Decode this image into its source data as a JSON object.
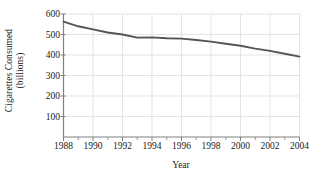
{
  "chart_data": {
    "type": "line",
    "title": "",
    "xlabel": "Year",
    "ylabel": "Cigarettes Consumed (billions)",
    "ylabel_line1": "Cigarettes Consumed",
    "ylabel_line2": "(billions)",
    "x": [
      1988,
      1989,
      1990,
      1991,
      1992,
      1993,
      1994,
      1995,
      1996,
      1997,
      1998,
      1999,
      2000,
      2001,
      2002,
      2003,
      2004
    ],
    "values": [
      563,
      540,
      525,
      510,
      500,
      485,
      486,
      482,
      480,
      473,
      465,
      455,
      445,
      431,
      420,
      406,
      392
    ],
    "series": [
      {
        "name": "Cigarettes Consumed",
        "values": [
          563,
          540,
          525,
          510,
          500,
          485,
          486,
          482,
          480,
          473,
          465,
          455,
          445,
          431,
          420,
          406,
          392
        ]
      }
    ],
    "xlim": [
      1988,
      2004
    ],
    "ylim": [
      0,
      600
    ],
    "ytick_labels": [
      "100",
      "200",
      "300",
      "400",
      "500",
      "600"
    ],
    "ytick_values": [
      100,
      200,
      300,
      400,
      500,
      600
    ],
    "xtick_labels": [
      "1988",
      "1990",
      "1992",
      "1994",
      "1996",
      "1998",
      "2000",
      "2002",
      "2004"
    ],
    "xtick_values": [
      1988,
      1990,
      1992,
      1994,
      1996,
      1998,
      2000,
      2002,
      2004
    ],
    "xminor_values": [
      1989,
      1991,
      1993,
      1995,
      1997,
      1999,
      2001,
      2003
    ],
    "grid": true,
    "legend": "none",
    "line_color": "#555555",
    "grid_color": "#d8d8d8",
    "axis_color": "#808080"
  }
}
